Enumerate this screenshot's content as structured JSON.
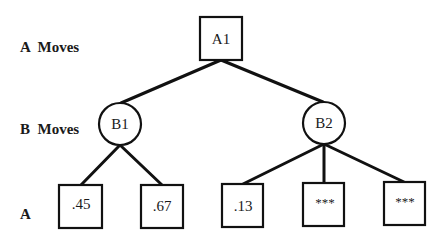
{
  "row_labels": [
    "A  Moves",
    "B  Moves",
    "A"
  ],
  "nodes": {
    "root": {
      "label": "A1",
      "shape": "square"
    },
    "b1": {
      "label": "B1",
      "shape": "circle"
    },
    "b2": {
      "label": "B2",
      "shape": "circle"
    },
    "leaves": [
      ".45",
      ".67",
      ".13",
      "***",
      "***"
    ]
  },
  "colors": {
    "stroke": "#111111",
    "background": "#ffffff"
  }
}
